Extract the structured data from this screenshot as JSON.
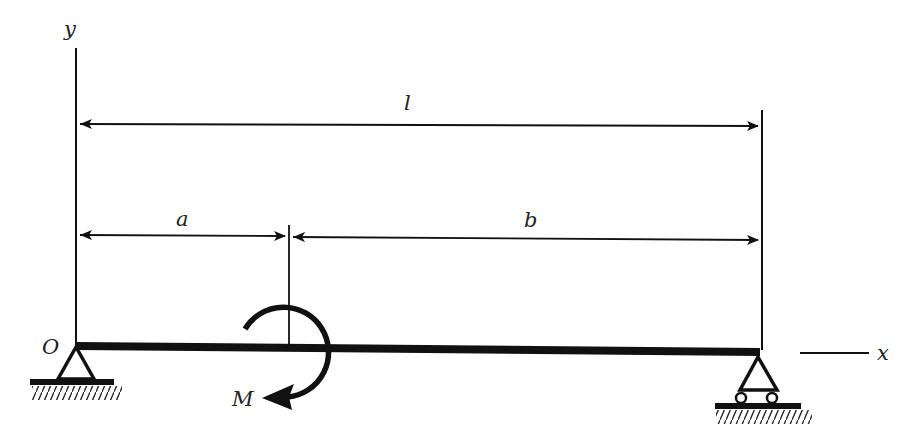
{
  "diagram": {
    "type": "simply-supported beam with concentrated moment",
    "labels": {
      "y_axis": "y",
      "x_axis": "x",
      "origin": "O",
      "span": "l",
      "left_segment": "a",
      "right_segment": "b",
      "moment": "M"
    },
    "supports": {
      "left": "pin",
      "right": "roller"
    },
    "colors": {
      "ink": "#111111",
      "label": "#222222",
      "background": "#ffffff"
    }
  }
}
